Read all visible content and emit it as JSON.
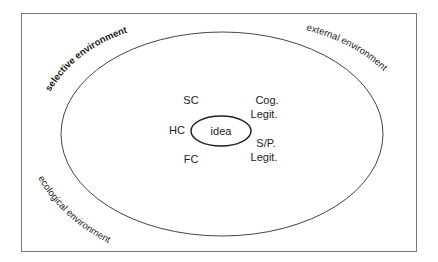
{
  "diagram": {
    "frame": {
      "x": 21,
      "y": 13,
      "width": 395,
      "height": 238,
      "stroke": "#777777"
    },
    "outer_ellipse": {
      "cx": 222,
      "cy": 134,
      "rx": 161,
      "ry": 102,
      "stroke": "#444444"
    },
    "inner_ellipse": {
      "cx": 221,
      "cy": 131,
      "rx": 30,
      "ry": 15,
      "stroke": "#222222",
      "label": "idea"
    },
    "environment_labels": {
      "selective": "selective environment",
      "external": "external environment",
      "ecological": "ecological environment"
    },
    "nodes": {
      "sc": "SC",
      "hc": "HC",
      "fc": "FC",
      "cog_legit_line1": "Cog.",
      "cog_legit_line2": "Legit.",
      "sp_legit_line1": "S/P.",
      "sp_legit_line2": "Legit."
    }
  }
}
